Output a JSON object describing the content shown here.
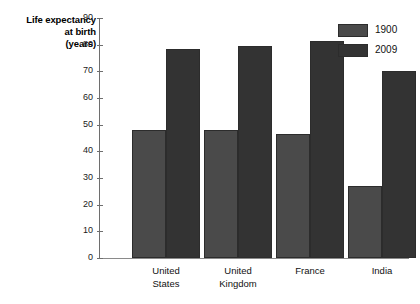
{
  "chart_data": {
    "type": "bar",
    "title": "",
    "subtitle": "",
    "xlabel": "",
    "ylabel": "Life expectancy at birth (years)",
    "ylabel_lines": [
      "Life expectancy",
      "at birth",
      "(years)"
    ],
    "categories": [
      "United States",
      "United Kingdom",
      "France",
      "India"
    ],
    "category_lines": [
      [
        "United",
        "States"
      ],
      [
        "United",
        "Kingdom"
      ],
      [
        "France",
        ""
      ],
      [
        "India",
        ""
      ]
    ],
    "series": [
      {
        "name": "1900",
        "color": "#4a4a4a",
        "values": [
          48,
          48,
          46.5,
          27
        ]
      },
      {
        "name": "2009",
        "color": "#333333",
        "values": [
          78.5,
          79.5,
          81.5,
          70
        ]
      }
    ],
    "ylim": [
      0,
      90
    ],
    "ytick_step": 10,
    "yticks": [
      0,
      10,
      20,
      30,
      40,
      50,
      60,
      70,
      80,
      90
    ],
    "ytick_labels": [
      "0",
      "10",
      "20",
      "30",
      "40",
      "50",
      "60",
      "70",
      "80",
      "90"
    ],
    "grid": false,
    "legend_position": "top-right",
    "axis_color": "#6e6e6e",
    "bar_edge_color": "#2c2c2c",
    "background": "#ffffff"
  },
  "legend": {
    "entries": [
      {
        "label": "1900"
      },
      {
        "label": "2009"
      }
    ]
  }
}
